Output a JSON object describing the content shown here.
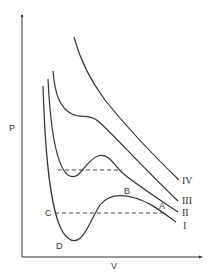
{
  "diagram": {
    "type": "pv-isotherms",
    "axes": {
      "x_label": "V",
      "y_label": "P"
    },
    "curves": [
      {
        "id": "I",
        "label": "I"
      },
      {
        "id": "II",
        "label": "II"
      },
      {
        "id": "III",
        "label": "III"
      },
      {
        "id": "IV",
        "label": "IV"
      }
    ],
    "points": {
      "A": "A",
      "B": "B",
      "C": "C",
      "D": "D"
    }
  }
}
